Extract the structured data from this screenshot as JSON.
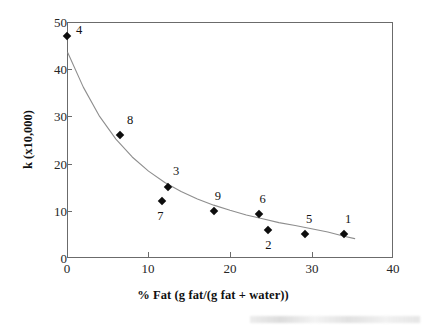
{
  "chart_data": {
    "type": "scatter",
    "title": "",
    "xlabel": "% Fat (g fat/(g fat + water))",
    "ylabel": "k (x10,000)",
    "xlim": [
      0,
      40
    ],
    "ylim": [
      0,
      50
    ],
    "xticks": [
      0,
      10,
      20,
      30,
      40
    ],
    "yticks": [
      0,
      10,
      20,
      30,
      40,
      50
    ],
    "xtick_labels": [
      "0",
      "10",
      "20",
      "30",
      "40"
    ],
    "ytick_labels": [
      "0",
      "10",
      "20",
      "30",
      "40",
      "50"
    ],
    "grid": false,
    "legend": "none",
    "frame": "box",
    "marker": "filled-diamond",
    "points": [
      {
        "label": "4",
        "x": 0.0,
        "y": 47.0,
        "label_dx": 9,
        "label_dy": -12
      },
      {
        "label": "8",
        "x": 6.5,
        "y": 26.0,
        "label_dx": 7,
        "label_dy": -21
      },
      {
        "label": "3",
        "x": 12.4,
        "y": 15.0,
        "label_dx": 5,
        "label_dy": -22
      },
      {
        "label": "7",
        "x": 11.7,
        "y": 12.0,
        "label_dx": -5,
        "label_dy": 9
      },
      {
        "label": "9",
        "x": 18.0,
        "y": 10.0,
        "label_dx": 1,
        "label_dy": -21
      },
      {
        "label": "6",
        "x": 23.5,
        "y": 9.3,
        "label_dx": 1,
        "label_dy": -21
      },
      {
        "label": "2",
        "x": 24.7,
        "y": 6.0,
        "label_dx": -3,
        "label_dy": 9
      },
      {
        "label": "5",
        "x": 29.2,
        "y": 5.0,
        "label_dx": 1,
        "label_dy": -21
      },
      {
        "label": "1",
        "x": 34.0,
        "y": 5.0,
        "label_dx": 1,
        "label_dy": -21
      }
    ],
    "fit_curve": {
      "kind": "exponential-decay",
      "description": "smooth decreasing trend line through the points",
      "x_start": 0.1,
      "x_end": 35.3,
      "y_start": 43.5,
      "y_end": 4.1,
      "samples_x": [
        0.1,
        2.0,
        4.0,
        6.0,
        8.0,
        10.0,
        12.0,
        14.0,
        16.0,
        18.0,
        20.0,
        22.0,
        24.0,
        26.0,
        28.0,
        30.0,
        32.0,
        34.0,
        35.3
      ],
      "samples_y": [
        43.5,
        36.2,
        30.0,
        25.2,
        21.4,
        18.4,
        16.0,
        14.1,
        12.5,
        11.2,
        10.1,
        9.1,
        8.3,
        7.5,
        6.9,
        6.2,
        5.5,
        4.6,
        4.1
      ]
    }
  }
}
